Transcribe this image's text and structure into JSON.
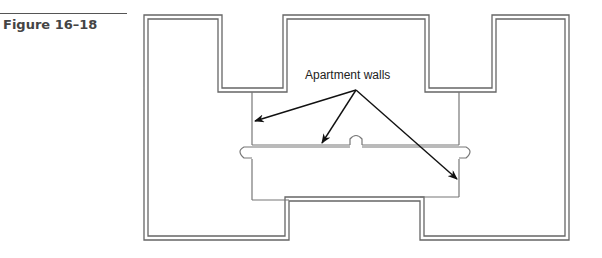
{
  "figure": {
    "label": "Figure 16–18"
  },
  "diagram": {
    "type": "floor-plan",
    "callout": "Apartment walls",
    "callout_targets": 3,
    "colors": {
      "wall": "#666666",
      "arrow": "#111111",
      "text": "#222222"
    }
  }
}
